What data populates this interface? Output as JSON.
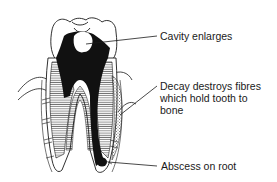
{
  "diagram": {
    "labels": [
      {
        "id": "cavity",
        "text": "Cavity enlarges"
      },
      {
        "id": "fibres",
        "text": "Decay destroys fibres\nwhich hold tooth to\nbone"
      },
      {
        "id": "abscess",
        "text": "Abscess on root"
      }
    ],
    "colors": {
      "ink": "#1a1a1a",
      "paper": "#ffffff",
      "stipple": "#777777"
    }
  }
}
